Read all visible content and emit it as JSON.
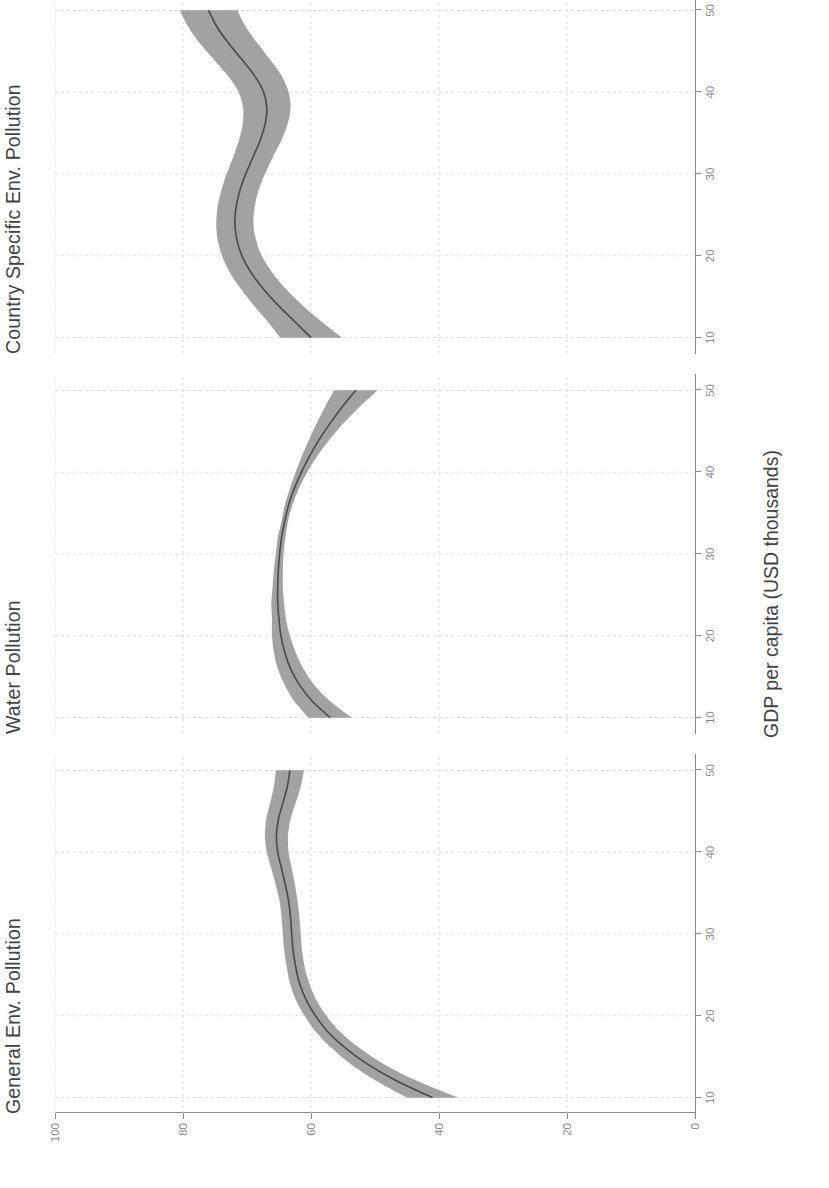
{
  "chart_data": {
    "type": "line",
    "title": "",
    "xlabel": "GDP per capita (USD thousands)",
    "ylabel": "",
    "xlim": [
      8,
      52
    ],
    "ylim": [
      0,
      100
    ],
    "xticks": [
      10,
      20,
      30,
      40,
      50
    ],
    "yticks": [
      0,
      20,
      40,
      60,
      80,
      100
    ],
    "xtick_labels": [
      "10",
      "20",
      "30",
      "40",
      "50"
    ],
    "ytick_labels": [
      "0",
      "20",
      "40",
      "60",
      "80",
      "100"
    ],
    "grid": "y-gridlines dashed light grey",
    "legend": "none",
    "orientation": "figure rotated 90 degrees counter-clockwise in the scan",
    "band_meaning": "shaded grey confidence interval around a dark grey mean line",
    "panels": [
      {
        "label": "General Env. Pollution",
        "x": [
          10,
          12,
          14,
          16,
          18,
          20,
          22,
          24,
          26,
          28,
          30,
          32,
          34,
          36,
          38,
          40,
          42,
          44,
          46,
          48,
          50
        ],
        "mean": [
          41.0,
          46.5,
          51.0,
          54.5,
          57.3,
          59.3,
          60.8,
          61.8,
          62.4,
          62.8,
          63.0,
          63.2,
          63.5,
          64.0,
          64.6,
          65.2,
          65.4,
          65.1,
          64.4,
          63.7,
          63.3
        ],
        "lower": [
          37.0,
          43.3,
          48.4,
          52.3,
          55.4,
          57.6,
          59.2,
          60.3,
          61.0,
          61.4,
          61.6,
          61.8,
          62.1,
          62.5,
          63.0,
          63.5,
          63.6,
          63.2,
          62.4,
          61.6,
          61.1
        ],
        "upper": [
          45.0,
          49.7,
          53.6,
          56.7,
          59.2,
          61.0,
          62.4,
          63.3,
          63.8,
          64.2,
          64.4,
          64.6,
          64.9,
          65.5,
          66.2,
          66.9,
          67.2,
          67.0,
          66.4,
          65.8,
          65.5
        ]
      },
      {
        "label": "Water Pollution",
        "x": [
          10,
          12,
          14,
          16,
          18,
          20,
          22,
          24,
          26,
          28,
          30,
          32,
          34,
          36,
          38,
          40,
          42,
          44,
          46,
          48,
          50
        ],
        "mean": [
          57.0,
          59.8,
          61.8,
          63.2,
          64.1,
          64.7,
          65.0,
          65.2,
          65.2,
          65.1,
          64.9,
          64.6,
          64.1,
          63.5,
          62.6,
          61.5,
          60.2,
          58.7,
          57.0,
          55.1,
          53.0
        ],
        "lower": [
          53.6,
          57.0,
          59.5,
          61.2,
          62.4,
          63.3,
          63.9,
          64.2,
          64.4,
          64.4,
          64.3,
          64.0,
          63.6,
          62.9,
          61.9,
          60.6,
          59.0,
          57.1,
          54.9,
          52.4,
          49.6
        ],
        "upper": [
          60.4,
          62.6,
          64.1,
          65.2,
          65.8,
          66.1,
          66.1,
          66.2,
          66.0,
          65.8,
          65.5,
          65.2,
          64.6,
          64.1,
          63.3,
          62.4,
          61.4,
          60.3,
          59.1,
          57.8,
          56.4
        ]
      },
      {
        "label": "Country Specific Env. Pollution",
        "x": [
          10,
          12,
          14,
          16,
          18,
          20,
          22,
          24,
          26,
          28,
          30,
          32,
          34,
          36,
          38,
          40,
          42,
          44,
          46,
          48,
          50
        ],
        "mean": [
          60.0,
          62.6,
          65.2,
          67.5,
          69.4,
          70.8,
          71.6,
          71.9,
          71.7,
          71.1,
          70.2,
          69.1,
          68.0,
          67.2,
          66.9,
          67.4,
          68.8,
          70.8,
          72.9,
          74.7,
          76.0
        ],
        "lower": [
          55.2,
          58.4,
          61.4,
          64.0,
          66.1,
          67.7,
          68.6,
          69.0,
          68.8,
          68.2,
          67.2,
          66.0,
          64.7,
          63.7,
          63.2,
          63.5,
          64.6,
          66.4,
          68.4,
          70.2,
          71.5
        ],
        "upper": [
          64.8,
          66.8,
          69.0,
          71.0,
          72.7,
          73.9,
          74.6,
          74.8,
          74.6,
          74.0,
          73.2,
          72.2,
          71.3,
          70.7,
          70.6,
          71.3,
          73.0,
          75.2,
          77.4,
          79.2,
          80.5
        ]
      }
    ]
  },
  "axis": {
    "x_title": "GDP per capita (USD thousands)"
  }
}
